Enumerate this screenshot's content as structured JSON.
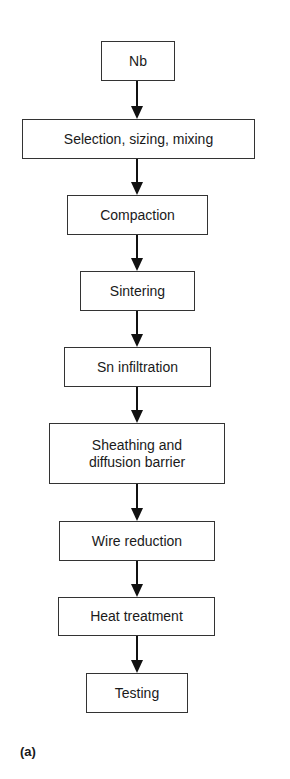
{
  "diagram": {
    "type": "flowchart",
    "direction": "top-to-bottom",
    "steps": [
      {
        "label": "Nb"
      },
      {
        "label": "Selection, sizing, mixing"
      },
      {
        "label": "Compaction"
      },
      {
        "label": "Sintering"
      },
      {
        "label": "Sn infiltration"
      },
      {
        "label": "Sheathing and\ndiffusion barrier"
      },
      {
        "label": "Wire reduction"
      },
      {
        "label": "Heat treatment"
      },
      {
        "label": "Testing"
      }
    ],
    "panel_label": "(a)"
  }
}
